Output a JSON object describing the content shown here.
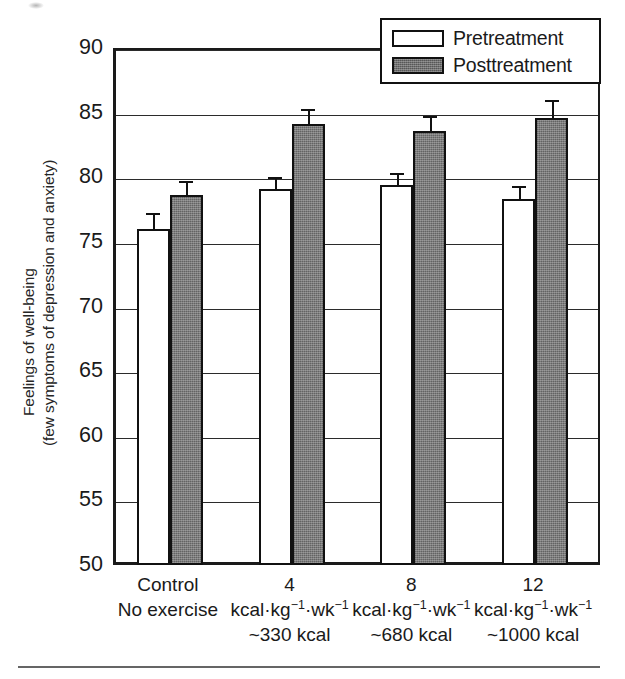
{
  "chart_data": {
    "type": "bar",
    "title": "",
    "xlabel": "",
    "ylabel": "Feelings of well-being (few symptoms of depression and anxiety)",
    "ylabel_line1": "Feelings of well-being",
    "ylabel_line2": "(few symptoms of depression and anxiety)",
    "ylim": [
      50,
      90
    ],
    "ytick_step": 5,
    "yticks": [
      50,
      55,
      60,
      65,
      70,
      75,
      80,
      85,
      90
    ],
    "ytick_labels": [
      "50",
      "55",
      "60",
      "65",
      "70",
      "75",
      "80",
      "85",
      "90"
    ],
    "grid": "horizontal",
    "legend_position": "top-right",
    "categories": [
      {
        "line1": "Control",
        "line2": "No exercise",
        "line3": ""
      },
      {
        "line1": "4",
        "line2": "kcal·kg⁻¹·wk⁻¹",
        "line3": "~330 kcal"
      },
      {
        "line1": "8",
        "line2": "kcal·kg⁻¹·wk⁻¹",
        "line3": "~680 kcal"
      },
      {
        "line1": "12",
        "line2": "kcal·kg⁻¹·wk⁻¹",
        "line3": "~1000 kcal"
      }
    ],
    "series": [
      {
        "name": "Pretreatment",
        "color": "#ffffff",
        "values": [
          76.0,
          79.1,
          79.4,
          78.3
        ],
        "errors": [
          1.2,
          0.9,
          0.9,
          1.0
        ]
      },
      {
        "name": "Posttreatment",
        "color": "#7c7c7c",
        "values": [
          78.6,
          84.15,
          83.6,
          84.6
        ],
        "errors": [
          1.1,
          1.15,
          1.15,
          1.4
        ]
      }
    ]
  },
  "legend": {
    "entries": [
      {
        "label": "Pretreatment",
        "swatch": "pre"
      },
      {
        "label": "Posttreatment",
        "swatch": "post"
      }
    ]
  },
  "axis": {
    "y_title_line1": "Feelings of well-being",
    "y_title_line2": "(few symptoms of depression and anxiety)"
  }
}
